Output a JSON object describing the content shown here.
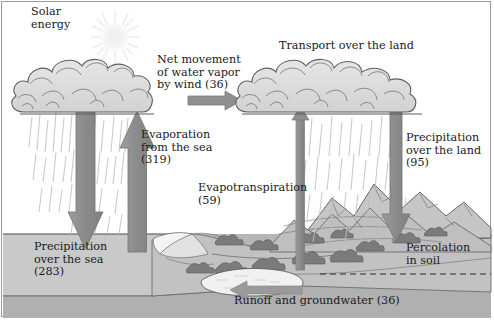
{
  "diagram": {
    "title_semantic": "global-water-cycle",
    "labels": {
      "solar_energy": "Solar\nenergy",
      "wind_transport": "Net movement\nof water vapor\nby wind (36)",
      "evaporation_sea": "Evaporation\nfrom the sea\n(319)",
      "transport_land": "Transport over the land",
      "precipitation_land": "Precipitation\nover the land\n(95)",
      "evapotranspiration": "Evapotranspiration\n(59)",
      "precipitation_sea": "Precipitation\nover the sea\n(283)",
      "percolation_soil": "Percolation\nin soil",
      "runoff_groundwater": "Runoff and groundwater (36)"
    },
    "values": {
      "wind_transport": 36,
      "evaporation_sea": 319,
      "precipitation_land": 95,
      "evapotranspiration": 59,
      "precipitation_sea": 283,
      "runoff_groundwater": 36
    },
    "colors": {
      "arrow_fill": "#8f8f8f",
      "arrow_stroke": "#7a7a7a",
      "cloud_fill": "#dcdcdc",
      "cloud_stroke": "#6e6e6e",
      "sea_fill": "#c9c9c9",
      "land_fill": "#bdbdbd",
      "mountain_fill": "#c4c4c4",
      "ground_fill": "#b4b4b4",
      "sun_fill": "#f2f2f2",
      "rain_stroke": "#b9b9b9",
      "outline": "#4a4a4a",
      "text": "#1a1a1a",
      "frame": "#9a9a9a",
      "lake_fill": "#f0f0f0",
      "shrub_fill": "#7e7e7e"
    },
    "icons": {
      "sun": "sun-icon",
      "cloud_left": "cloud-icon",
      "cloud_right": "cloud-icon",
      "arrow_down_sea": "arrow-down-icon",
      "arrow_up_sea": "arrow-up-icon",
      "arrow_right_wind": "arrow-right-icon",
      "arrow_up_land": "arrow-up-icon",
      "arrow_down_land": "arrow-down-icon",
      "arrow_left_runoff": "arrow-left-icon",
      "groundwater_line": "dashed-line-icon"
    }
  }
}
